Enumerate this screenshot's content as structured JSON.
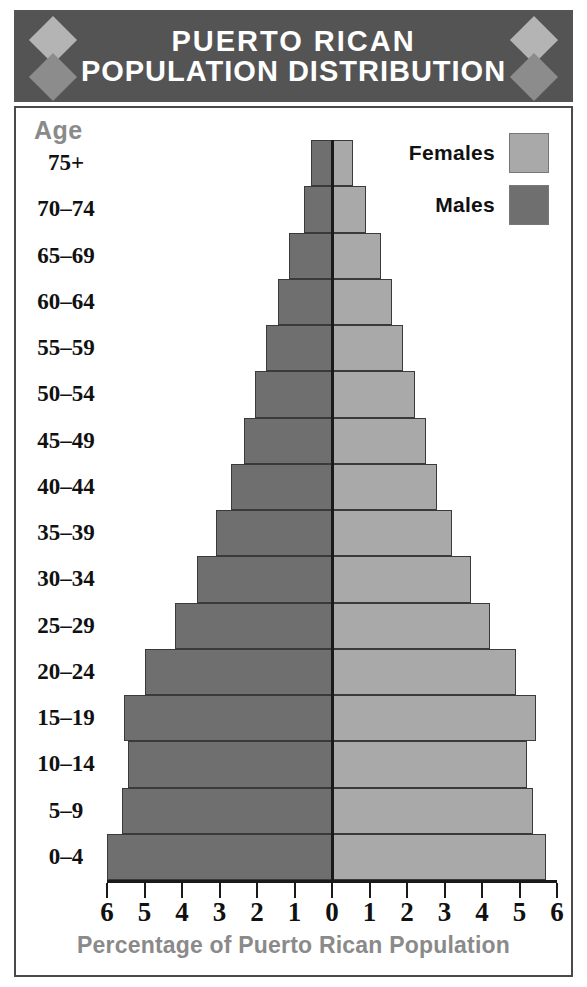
{
  "header": {
    "title_line1": "PUERTO RICAN",
    "title_line2": "POPULATION DISTRIBUTION",
    "background_color": "#545454",
    "diamond_light_color": "#b4b4b4",
    "diamond_dark_color": "#8c8c8c"
  },
  "axis_header": {
    "age_label": "Age"
  },
  "legend": {
    "position": "top-right",
    "items": [
      {
        "label": "Females",
        "color": "#a9a9a9"
      },
      {
        "label": "Males",
        "color": "#6f6f6f"
      }
    ]
  },
  "chart_data": {
    "type": "bar",
    "subtype": "population-pyramid",
    "title": "PUERTO RICAN POPULATION DISTRIBUTION",
    "xlabel": "Percentage of Puerto Rican Population",
    "ylabel": "Age",
    "xlim": [
      -6,
      6
    ],
    "xtick_values": [
      -6,
      -5,
      -4,
      -3,
      -2,
      -1,
      0,
      1,
      2,
      3,
      4,
      5,
      6
    ],
    "xtick_labels": [
      "6",
      "5",
      "4",
      "3",
      "2",
      "1",
      "0",
      "1",
      "2",
      "3",
      "4",
      "5",
      "6"
    ],
    "grid": false,
    "legend_position": "top-right",
    "categories": [
      "75+",
      "70-74",
      "65-69",
      "60-64",
      "55-59",
      "50-54",
      "45-49",
      "40-44",
      "35-39",
      "30-34",
      "25-29",
      "20-24",
      "15-19",
      "10-14",
      "5-9",
      "0-4"
    ],
    "series": [
      {
        "name": "Males",
        "color": "#6f6f6f",
        "side": "left",
        "values": [
          0.55,
          0.75,
          1.15,
          1.45,
          1.75,
          2.05,
          2.35,
          2.7,
          3.1,
          3.6,
          4.2,
          5.0,
          5.55,
          5.45,
          5.6,
          6.0
        ]
      },
      {
        "name": "Females",
        "color": "#a9a9a9",
        "side": "right",
        "values": [
          0.55,
          0.9,
          1.3,
          1.6,
          1.9,
          2.2,
          2.5,
          2.8,
          3.2,
          3.7,
          4.2,
          4.9,
          5.45,
          5.2,
          5.35,
          5.7
        ]
      }
    ]
  }
}
